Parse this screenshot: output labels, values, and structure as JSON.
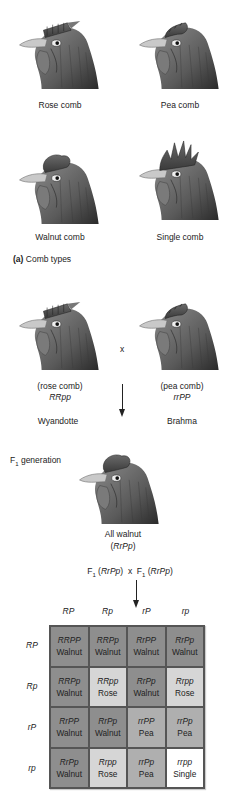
{
  "comb_types": {
    "items": [
      {
        "label": "Rose comb",
        "comb": "rose"
      },
      {
        "label": "Pea comb",
        "comb": "pea"
      },
      {
        "label": "Walnut comb",
        "comb": "walnut"
      },
      {
        "label": "Single comb",
        "comb": "single"
      }
    ],
    "panel_label_prefix": "(a)",
    "panel_label": "Comb types"
  },
  "cross": {
    "symbol": "x",
    "parent1": {
      "phenotype": "(rose comb)",
      "genotype": "RRpp",
      "breed": "Wyandotte"
    },
    "parent2": {
      "phenotype": "(pea comb)",
      "genotype": "rrPP",
      "breed": "Brahma"
    },
    "f1_label": "F",
    "f1_sub": "1",
    "f1_label_rest": " generation",
    "f1_result": "All walnut",
    "f1_genotype_open": "(",
    "f1_genotype": "RrPp",
    "f1_genotype_close": ")",
    "f1_cross": {
      "left_f": "F",
      "left_sub": "1",
      "left_open": " (",
      "left_geno": "RrPp",
      "left_close": ")",
      "x": "x",
      "right_f": "F",
      "right_sub": "1",
      "right_open": " (",
      "right_geno": "RrPp",
      "right_close": ")"
    }
  },
  "punnett": {
    "col_headers": [
      "RP",
      "Rp",
      "rP",
      "rp"
    ],
    "row_headers": [
      "RP",
      "Rp",
      "rP",
      "rp"
    ],
    "colors": {
      "Walnut": "#8e8e8e",
      "Rose": "#d6d6d6",
      "Pea": "#afafaf",
      "Single": "#ffffff"
    },
    "cells": [
      [
        {
          "genotype": "RRPP",
          "phenotype": "Walnut"
        },
        {
          "genotype": "RRPp",
          "phenotype": "Walnut"
        },
        {
          "genotype": "RrPP",
          "phenotype": "Walnut"
        },
        {
          "genotype": "RrPp",
          "phenotype": "Walnut"
        }
      ],
      [
        {
          "genotype": "RRPp",
          "phenotype": "Walnut"
        },
        {
          "genotype": "RRpp",
          "phenotype": "Rose"
        },
        {
          "genotype": "RrPp",
          "phenotype": "Walnut"
        },
        {
          "genotype": "Rrpp",
          "phenotype": "Rose"
        }
      ],
      [
        {
          "genotype": "RrPP",
          "phenotype": "Walnut"
        },
        {
          "genotype": "RrPp",
          "phenotype": "Walnut"
        },
        {
          "genotype": "rrPP",
          "phenotype": "Pea"
        },
        {
          "genotype": "rrPp",
          "phenotype": "Pea"
        }
      ],
      [
        {
          "genotype": "RrPp",
          "phenotype": "Walnut"
        },
        {
          "genotype": "Rrpp",
          "phenotype": "Rose"
        },
        {
          "genotype": "rrPp",
          "phenotype": "Pea"
        },
        {
          "genotype": "rrpp",
          "phenotype": "Single"
        }
      ]
    ]
  }
}
